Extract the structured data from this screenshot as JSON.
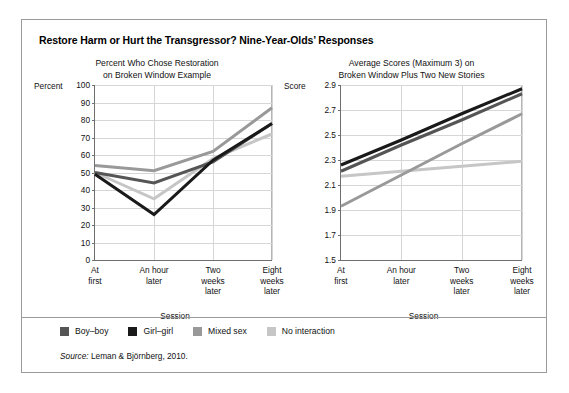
{
  "figure": {
    "title": "Restore Harm or Hurt the Transgressor? Nine-Year-Olds’ Responses",
    "source_prefix": "Source:",
    "source_text": "Leman & Björnberg, 2010."
  },
  "legend": {
    "items": [
      {
        "label": "Boy–boy",
        "color": "#555555"
      },
      {
        "label": "Girl–girl",
        "color": "#1a1a1a"
      },
      {
        "label": "Mixed sex",
        "color": "#999999"
      },
      {
        "label": "No interaction",
        "color": "#c6c6c6"
      }
    ]
  },
  "chart_data": [
    {
      "type": "line",
      "title": "Percent Who Chose Restoration on Broken Window Example",
      "title_line1": "Percent Who Chose Restoration",
      "title_line2": "on Broken Window Example",
      "xlabel": "Session",
      "ylabel": "Percent",
      "categories": [
        "At first",
        "An hour later",
        "Two weeks later",
        "Eight weeks later"
      ],
      "category_lines": [
        [
          "At",
          "first"
        ],
        [
          "An hour",
          "later"
        ],
        [
          "Two",
          "weeks",
          "later"
        ],
        [
          "Eight",
          "weeks",
          "later"
        ]
      ],
      "ylim": [
        0,
        100
      ],
      "yticks": [
        0,
        10,
        20,
        30,
        40,
        50,
        60,
        70,
        80,
        90,
        100
      ],
      "grid": true,
      "legend_position": "below",
      "series": [
        {
          "name": "Boy–boy",
          "color": "#555555",
          "values": [
            50,
            44,
            56,
            78
          ]
        },
        {
          "name": "Girl–girl",
          "color": "#1a1a1a",
          "values": [
            49,
            26,
            57,
            78
          ]
        },
        {
          "name": "Mixed sex",
          "color": "#999999",
          "values": [
            54,
            51,
            62,
            87
          ]
        },
        {
          "name": "No interaction",
          "color": "#c6c6c6",
          "values": [
            50,
            35,
            58,
            72
          ]
        }
      ]
    },
    {
      "type": "line",
      "title": "Average Scores (Maximum 3) on Broken Window Plus Two New Stories",
      "title_line1": "Average Scores (Maximum 3) on",
      "title_line2": "Broken Window Plus Two New Stories",
      "xlabel": "Session",
      "ylabel": "Score",
      "categories": [
        "At first",
        "An hour later",
        "Two weeks later",
        "Eight weeks later"
      ],
      "category_lines": [
        [
          "At",
          "first"
        ],
        [
          "An hour",
          "later"
        ],
        [
          "Two",
          "weeks",
          "later"
        ],
        [
          "Eight",
          "weeks",
          "later"
        ]
      ],
      "ylim": [
        1.5,
        2.9
      ],
      "yticks": [
        "1.5",
        "1.7",
        "1.9",
        "2.1",
        "2.3",
        "2.5",
        "2.7",
        "2.9"
      ],
      "ytick_values": [
        1.5,
        1.7,
        1.9,
        2.1,
        2.3,
        2.5,
        2.7,
        2.9
      ],
      "grid": true,
      "legend_position": "below",
      "series": [
        {
          "name": "Boy–boy",
          "color": "#555555",
          "values": [
            2.21,
            2.42,
            2.62,
            2.83
          ]
        },
        {
          "name": "Girl–girl",
          "color": "#1a1a1a",
          "values": [
            2.26,
            2.46,
            2.67,
            2.87
          ]
        },
        {
          "name": "Mixed sex",
          "color": "#999999",
          "values": [
            1.93,
            2.18,
            2.43,
            2.67
          ]
        },
        {
          "name": "No interaction",
          "color": "#c6c6c6",
          "values": [
            2.17,
            2.21,
            2.25,
            2.29
          ]
        }
      ]
    }
  ]
}
